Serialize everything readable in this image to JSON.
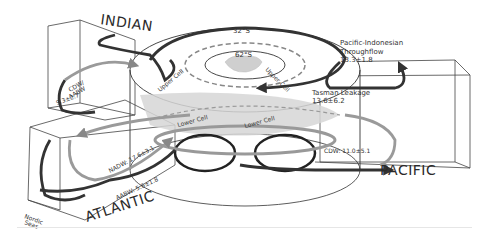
{
  "diagram": {
    "basins": [
      {
        "name": "INDIAN"
      },
      {
        "name": "ATLANTIC"
      },
      {
        "name": "PACIFIC"
      }
    ],
    "latitudes": {
      "outer": "32°S",
      "inner": "62°S"
    },
    "cells": {
      "upper_left": "Upper Cell",
      "upper_right": "Upper Cell",
      "lower_left": "Lower Cell",
      "lower_right": "Lower Cell"
    },
    "flows": {
      "pacific_indonesian": {
        "name": "Pacific-Indonesian",
        "name2": "Throughflow",
        "value": "13.3±1.8"
      },
      "tasman": {
        "name": "Tasman Leakage",
        "value": "13.6±6.2"
      },
      "cdw_pacific": {
        "label": "CDW: 11.0±5.1"
      },
      "nadw": {
        "label": "NADW: 17.6±3.1"
      },
      "aabw": {
        "label": "AABW: 5.6±1.8"
      },
      "cdw_indian": {
        "label1": "CDW/",
        "label2": "AABW",
        "value": "9.3±2.7"
      },
      "nordic": {
        "label1": "Nordic",
        "label2": "Seas"
      }
    }
  }
}
